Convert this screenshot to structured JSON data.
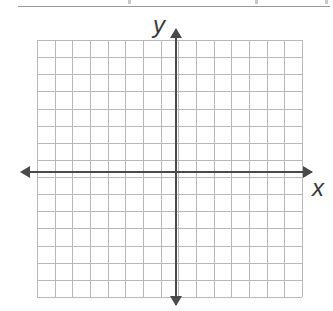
{
  "page": {
    "width": 333,
    "height": 311,
    "background_color": "#ffffff"
  },
  "top_rule": {
    "present": true,
    "color": "#9a9a9a",
    "cropped_text_fragments": [
      "",
      "",
      ""
    ]
  },
  "axes": {
    "color": "#4a4a4a",
    "x_axis": {
      "label": "x",
      "label_style": "italic",
      "arrow_left": "arrow-left-icon",
      "arrow_right": "arrow-right-icon"
    },
    "y_axis": {
      "label": "y",
      "label_style": "italic",
      "arrow_up": "arrow-up-icon",
      "arrow_down": "arrow-down-icon"
    }
  },
  "chart_data": {
    "type": "scatter",
    "title": "",
    "subtitle": "",
    "xlabel": "x",
    "ylabel": "y",
    "xlim": [
      -8,
      7
    ],
    "ylim": [
      -7,
      8
    ],
    "x_tick_labels": [],
    "y_tick_labels": [],
    "grid": true,
    "grid_color": "#b9b9b9",
    "grid_columns": 15,
    "grid_rows": 15,
    "legend": null,
    "legend_position": "none",
    "annotations": [],
    "series": [
      {
        "name": "",
        "x": [],
        "y": []
      }
    ],
    "note": "Empty coordinate plane: no plotted data points, no numeric tick labels."
  }
}
